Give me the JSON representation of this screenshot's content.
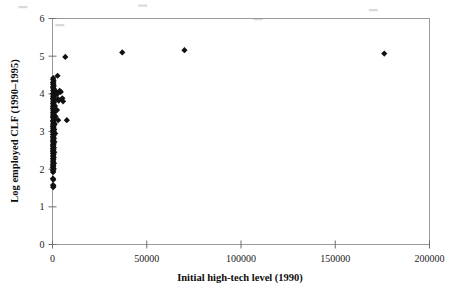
{
  "chart_data": {
    "type": "scatter",
    "title": "",
    "xlabel": "Initial high-tech level (1990)",
    "ylabel": "Log employed CLF (1990–1995)",
    "xlim": [
      0,
      200000
    ],
    "ylim": [
      0,
      6
    ],
    "xticks": [
      0,
      50000,
      100000,
      150000,
      200000
    ],
    "yticks": [
      0,
      1,
      2,
      3,
      4,
      5,
      6
    ],
    "xtick_labels": [
      "0",
      "50000",
      "100000",
      "150000",
      "200000"
    ],
    "ytick_labels": [
      "0",
      "1",
      "2",
      "3",
      "4",
      "5",
      "6"
    ],
    "grid": false,
    "legend": false,
    "marker": "diamond",
    "marker_color": "#111111",
    "frame_color": "#9a9a9a",
    "points": [
      [
        400,
        4.42
      ],
      [
        300,
        4.38
      ],
      [
        600,
        4.34
      ],
      [
        250,
        4.3
      ],
      [
        500,
        4.27
      ],
      [
        350,
        4.24
      ],
      [
        700,
        4.21
      ],
      [
        200,
        4.18
      ],
      [
        450,
        4.15
      ],
      [
        900,
        4.12
      ],
      [
        300,
        4.09
      ],
      [
        1500,
        4.06
      ],
      [
        600,
        4.03
      ],
      [
        250,
        4.0
      ],
      [
        2600,
        4.0
      ],
      [
        400,
        3.97
      ],
      [
        1100,
        3.95
      ],
      [
        300,
        3.92
      ],
      [
        700,
        3.9
      ],
      [
        200,
        3.87
      ],
      [
        500,
        3.85
      ],
      [
        2900,
        3.86
      ],
      [
        3300,
        3.82
      ],
      [
        350,
        3.8
      ],
      [
        900,
        3.78
      ],
      [
        250,
        3.75
      ],
      [
        600,
        3.73
      ],
      [
        400,
        3.7
      ],
      [
        1300,
        3.68
      ],
      [
        300,
        3.66
      ],
      [
        800,
        3.63
      ],
      [
        200,
        3.61
      ],
      [
        550,
        3.58
      ],
      [
        2400,
        3.57
      ],
      [
        350,
        3.55
      ],
      [
        1000,
        3.52
      ],
      [
        250,
        3.5
      ],
      [
        700,
        3.47
      ],
      [
        450,
        3.45
      ],
      [
        300,
        3.42
      ],
      [
        1600,
        3.4
      ],
      [
        200,
        3.38
      ],
      [
        600,
        3.35
      ],
      [
        850,
        3.33
      ],
      [
        350,
        3.3
      ],
      [
        3000,
        3.3
      ],
      [
        250,
        3.28
      ],
      [
        500,
        3.25
      ],
      [
        400,
        3.22
      ],
      [
        1200,
        3.2
      ],
      [
        300,
        3.18
      ],
      [
        700,
        3.15
      ],
      [
        200,
        3.13
      ],
      [
        550,
        3.1
      ],
      [
        350,
        3.08
      ],
      [
        950,
        3.05
      ],
      [
        250,
        3.03
      ],
      [
        450,
        3.0
      ],
      [
        300,
        2.97
      ],
      [
        1400,
        2.95
      ],
      [
        200,
        2.92
      ],
      [
        650,
        2.9
      ],
      [
        400,
        2.87
      ],
      [
        250,
        2.85
      ],
      [
        800,
        2.82
      ],
      [
        300,
        2.8
      ],
      [
        500,
        2.77
      ],
      [
        200,
        2.75
      ],
      [
        1000,
        2.72
      ],
      [
        350,
        2.7
      ],
      [
        600,
        2.67
      ],
      [
        250,
        2.65
      ],
      [
        420,
        2.62
      ],
      [
        300,
        2.6
      ],
      [
        750,
        2.57
      ],
      [
        200,
        2.55
      ],
      [
        520,
        2.52
      ],
      [
        350,
        2.5
      ],
      [
        280,
        2.47
      ],
      [
        900,
        2.45
      ],
      [
        230,
        2.42
      ],
      [
        600,
        2.4
      ],
      [
        400,
        2.37
      ],
      [
        300,
        2.34
      ],
      [
        700,
        2.31
      ],
      [
        210,
        2.28
      ],
      [
        480,
        2.25
      ],
      [
        330,
        2.22
      ],
      [
        260,
        2.19
      ],
      [
        800,
        2.16
      ],
      [
        200,
        2.13
      ],
      [
        440,
        2.1
      ],
      [
        320,
        2.07
      ],
      [
        240,
        2.04
      ],
      [
        600,
        2.01
      ],
      [
        210,
        1.98
      ],
      [
        380,
        1.95
      ],
      [
        300,
        1.92
      ],
      [
        250,
        1.75
      ],
      [
        420,
        1.72
      ],
      [
        300,
        1.58
      ],
      [
        500,
        1.55
      ],
      [
        350,
        1.52
      ],
      [
        2700,
        4.48
      ],
      [
        6800,
        4.98
      ],
      [
        7600,
        3.3
      ],
      [
        5200,
        3.88
      ],
      [
        5600,
        3.8
      ],
      [
        4400,
        4.05
      ],
      [
        3800,
        4.08
      ],
      [
        37000,
        5.1
      ],
      [
        70000,
        5.16
      ],
      [
        176000,
        5.07
      ]
    ],
    "artifact_specks": [
      [
        0.04,
        0.02
      ],
      [
        0.3,
        0.015
      ],
      [
        0.8,
        0.03
      ],
      [
        0.12,
        0.08
      ],
      [
        0.55,
        0.06
      ]
    ]
  }
}
